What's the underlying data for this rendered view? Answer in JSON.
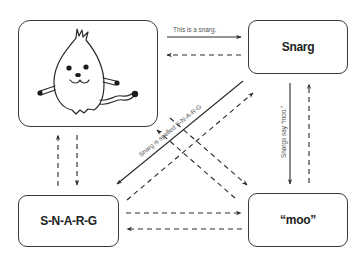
{
  "diagram": {
    "nodes": {
      "picture": {
        "label": "",
        "image": "snarg-creature-drawing",
        "x": 18,
        "y": 20,
        "w": 140,
        "h": 107
      },
      "word": {
        "label": "Snarg",
        "x": 248,
        "y": 20,
        "w": 100,
        "h": 54
      },
      "spelling": {
        "label": "S-N-A-R-G",
        "x": 18,
        "y": 195,
        "w": 101,
        "h": 52
      },
      "sound": {
        "label": "“moo”",
        "x": 248,
        "y": 193,
        "w": 100,
        "h": 54
      }
    },
    "edges": [
      {
        "from": "picture",
        "to": "word",
        "style": "solid",
        "label": "This is a snarg."
      },
      {
        "from": "word",
        "to": "picture",
        "style": "dashed",
        "label": ""
      },
      {
        "from": "word",
        "to": "spelling",
        "style": "solid",
        "label": "Snarg is spelled S-N-A-R-G"
      },
      {
        "from": "word",
        "to": "sound",
        "style": "solid",
        "label": "Snargs say “moo.”"
      },
      {
        "from": "sound",
        "to": "word",
        "style": "dashed",
        "label": ""
      },
      {
        "from": "picture",
        "to": "spelling",
        "style": "dashed",
        "label": ""
      },
      {
        "from": "spelling",
        "to": "picture",
        "style": "dashed",
        "label": ""
      },
      {
        "from": "spelling",
        "to": "sound",
        "style": "dashed",
        "label": ""
      },
      {
        "from": "sound",
        "to": "spelling",
        "style": "dashed",
        "label": ""
      },
      {
        "from": "picture",
        "to": "sound",
        "style": "dashed",
        "label": ""
      },
      {
        "from": "sound",
        "to": "picture",
        "style": "dashed",
        "label": ""
      },
      {
        "from": "spelling",
        "to": "word",
        "style": "dashed",
        "label": ""
      }
    ],
    "colors": {
      "stroke": "#3a3a3a",
      "text": "#222222",
      "edge_label": "#555555",
      "background": "#ffffff"
    }
  }
}
